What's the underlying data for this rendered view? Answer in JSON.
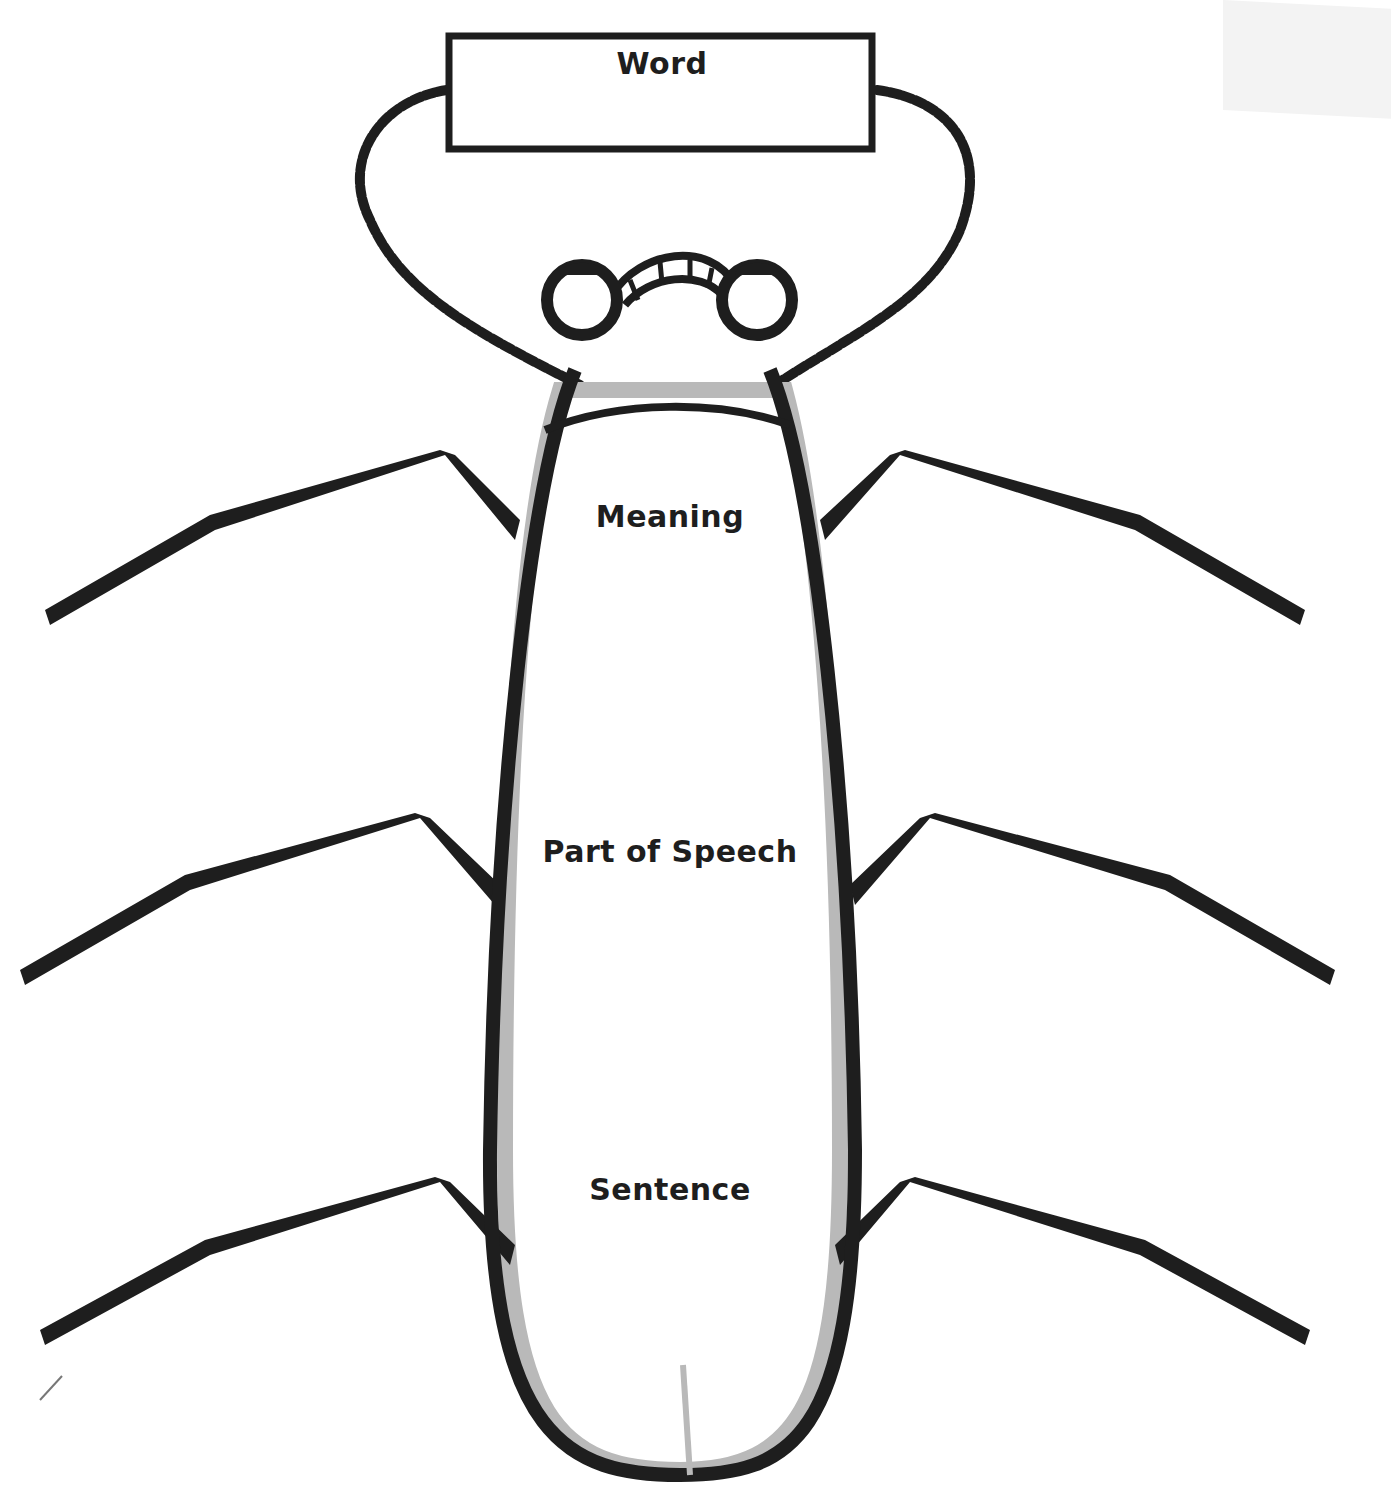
{
  "worksheet": {
    "title": "Vocabulary Bug Graphic Organizer",
    "labels": {
      "word": "Word",
      "meaning": "Meaning",
      "part_of_speech": "Part of Speech",
      "sentence": "Sentence"
    },
    "fields": {
      "word_value": "",
      "meaning_value": "",
      "part_of_speech_value": "",
      "sentence_value": ""
    }
  },
  "colors": {
    "outline": "#1e1e1e",
    "shadow": "#b9b9b9",
    "paper": "#ffffff",
    "corner_sheet": "#f3f3f3"
  }
}
